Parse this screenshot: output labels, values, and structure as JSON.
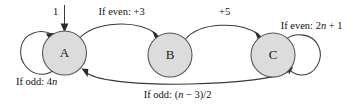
{
  "diagram": {
    "type": "state-machine",
    "canvas": {
      "width": 357,
      "height": 104
    },
    "colors": {
      "state_fill": "#dcdcdc",
      "state_stroke": "#555555",
      "edge_stroke": "#3a3a3a",
      "text": "#111111",
      "background": "#ffffff"
    },
    "states": [
      {
        "id": "A",
        "label": "A",
        "cx": 64.5,
        "cy": 53,
        "r": 22
      },
      {
        "id": "B",
        "label": "B",
        "cx": 170,
        "cy": 55,
        "r": 22
      },
      {
        "id": "C",
        "label": "C",
        "cx": 273,
        "cy": 55,
        "r": 22
      }
    ],
    "start": {
      "label": "1",
      "target": "A",
      "label_x": 53,
      "label_y": 13
    },
    "transitions": [
      {
        "id": "a-to-b",
        "from": "A",
        "to": "B",
        "label": "If even: +3",
        "label_parts": [
          {
            "text": "If even: +3",
            "italic": false
          }
        ],
        "label_x": 119,
        "label_y": 13
      },
      {
        "id": "b-to-c",
        "from": "B",
        "to": "C",
        "label": "+5",
        "label_parts": [
          {
            "text": "+5",
            "italic": false
          }
        ],
        "label_x": 222,
        "label_y": 13
      },
      {
        "id": "c-to-a",
        "from": "C",
        "to": "A",
        "label": "If odd: (n − 3)/2",
        "label_parts": [
          {
            "text": "If odd: (",
            "italic": false
          },
          {
            "text": "n",
            "italic": true
          },
          {
            "text": " − 3)/2",
            "italic": false
          }
        ],
        "label_x": 175,
        "label_y": 96
      },
      {
        "id": "a-self-loop",
        "from": "A",
        "to": "A",
        "label": "If odd: 4n",
        "label_parts": [
          {
            "text": "If odd: 4",
            "italic": false
          },
          {
            "text": "n",
            "italic": true
          }
        ],
        "label_x": 34,
        "label_y": 83
      },
      {
        "id": "c-self-loop",
        "from": "C",
        "to": "C",
        "label": "If even: 2n + 1",
        "label_parts": [
          {
            "text": "If even: 2",
            "italic": false
          },
          {
            "text": "n",
            "italic": true
          },
          {
            "text": " + 1",
            "italic": false
          }
        ],
        "label_x": 309,
        "label_y": 27
      }
    ]
  }
}
